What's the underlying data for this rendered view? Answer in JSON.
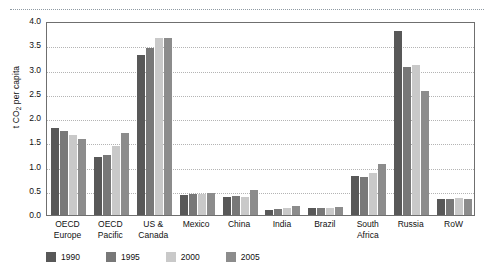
{
  "chart_data": {
    "type": "bar",
    "title": "",
    "subtitle": "",
    "xlabel": "",
    "ylabel": "t CO2 per capita",
    "ylabel_main": "t CO",
    "ylabel_sub": "2",
    "ylabel_tail": " per capita",
    "ylim": [
      0.0,
      4.0
    ],
    "ytick_values": [
      0.0,
      0.5,
      1.0,
      1.5,
      2.0,
      2.5,
      3.0,
      3.5,
      4.0
    ],
    "ytick_labels": [
      "0.0",
      "0.5",
      "1.0",
      "1.5",
      "2.0",
      "2.5",
      "3.0",
      "3.5",
      "4.0"
    ],
    "grid": true,
    "grid_style": "dotted-horizontal",
    "legend_position": "bottom-left",
    "categories": [
      "OECD Europe",
      "OECD Pacific",
      "US & Canada",
      "Mexico",
      "China",
      "India",
      "Brazil",
      "South Africa",
      "Russia",
      "RoW"
    ],
    "category_lines": [
      [
        "OECD",
        "Europe"
      ],
      [
        "OECD",
        "Pacific"
      ],
      [
        "US &",
        "Canada"
      ],
      [
        "Mexico",
        ""
      ],
      [
        "China",
        ""
      ],
      [
        "India",
        ""
      ],
      [
        "Brazil",
        ""
      ],
      [
        "South",
        "Africa"
      ],
      [
        "Russia",
        ""
      ],
      [
        "RoW",
        ""
      ]
    ],
    "series": [
      {
        "name": "1990",
        "color": "#585858",
        "values": [
          1.8,
          1.2,
          3.3,
          0.42,
          0.38,
          0.1,
          0.14,
          0.8,
          3.8,
          0.32
        ]
      },
      {
        "name": "1995",
        "color": "#787878",
        "values": [
          1.74,
          1.23,
          3.45,
          0.44,
          0.4,
          0.12,
          0.15,
          0.78,
          3.05,
          0.33
        ]
      },
      {
        "name": "2000",
        "color": "#c9c9c9",
        "values": [
          1.64,
          1.42,
          3.66,
          0.44,
          0.38,
          0.14,
          0.15,
          0.87,
          3.1,
          0.35
        ]
      },
      {
        "name": "2005",
        "color": "#8c8c8c",
        "values": [
          1.57,
          1.7,
          3.65,
          0.46,
          0.52,
          0.18,
          0.16,
          1.05,
          2.55,
          0.34
        ]
      }
    ]
  },
  "legend": {
    "items": [
      {
        "label": "1990",
        "color": "#585858"
      },
      {
        "label": "1995",
        "color": "#787878"
      },
      {
        "label": "2000",
        "color": "#c9c9c9"
      },
      {
        "label": "2005",
        "color": "#8c8c8c"
      }
    ]
  },
  "colors": {
    "axis": "#6f6f6f",
    "grid": "#b4b4b4",
    "text": "#111111",
    "background": "#ffffff",
    "top_rule": "#8f9aa3"
  }
}
